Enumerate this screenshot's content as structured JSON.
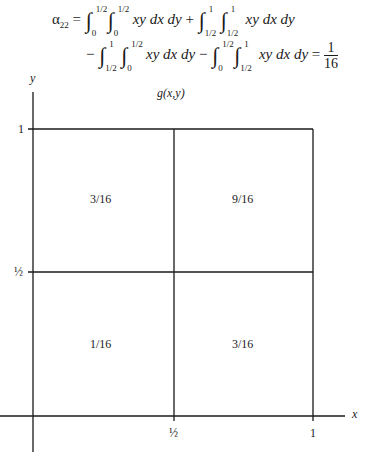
{
  "equation": {
    "lhs": "α",
    "lhs_sub": "22",
    "line1": [
      {
        "lower": "0",
        "upper": "1/2"
      },
      {
        "lower": "0",
        "upper": "1/2"
      },
      {
        "lower": "1/2",
        "upper": "1"
      },
      {
        "lower": "1/2",
        "upper": "1"
      }
    ],
    "line2": [
      {
        "lower": "1/2",
        "upper": "1"
      },
      {
        "lower": "0",
        "upper": "1/2"
      },
      {
        "lower": "0",
        "upper": "1/2"
      },
      {
        "lower": "1/2",
        "upper": "1"
      }
    ],
    "integrand": "xy dx dy",
    "result_num": "1",
    "result_den": "16"
  },
  "figure": {
    "function_label": "g(x,y)",
    "x_axis_label": "x",
    "y_axis_label": "y",
    "x_ticks": [
      "½",
      "1"
    ],
    "y_ticks": [
      "½",
      "1"
    ],
    "cells": {
      "top_left": "3/16",
      "top_right": "9/16",
      "bottom_left": "1/16",
      "bottom_right": "3/16"
    }
  }
}
